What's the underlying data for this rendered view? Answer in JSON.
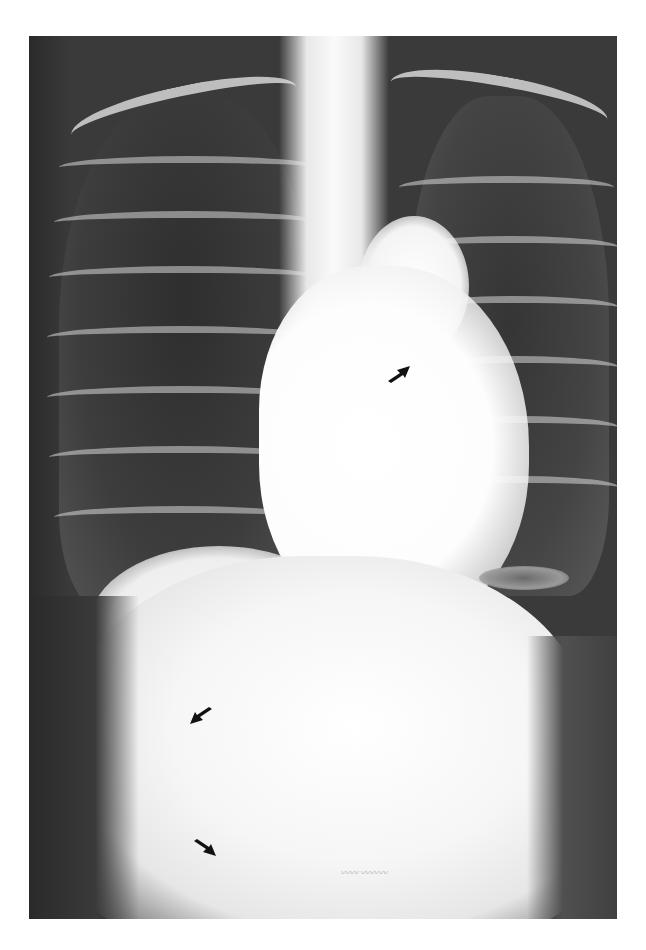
{
  "figure": {
    "kind": "chest radiograph",
    "view": "frontal",
    "background_color": "#ffffff",
    "image_tone": "grayscale",
    "arrows": [
      {
        "id": "arrow-mediastinum",
        "direction": "up-right",
        "color": "#111111",
        "x": 388,
        "y": 366
      },
      {
        "id": "arrow-upper-abdomen",
        "direction": "down-left",
        "color": "#111111",
        "x": 190,
        "y": 706
      },
      {
        "id": "arrow-lower-abdomen",
        "direction": "down-right",
        "color": "#111111",
        "x": 192,
        "y": 840
      }
    ],
    "signature_text": "〰〰 〰〰〰"
  }
}
